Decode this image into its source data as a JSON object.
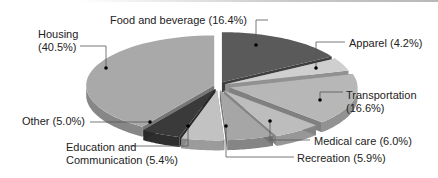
{
  "chart_data": {
    "type": "pie",
    "style": "3d-exploded",
    "title": "",
    "categories": [
      "Food and beverage",
      "Apparel",
      "Transportation",
      "Medical care",
      "Recreation",
      "Education and Communication",
      "Other",
      "Housing"
    ],
    "values": [
      16.4,
      4.2,
      16.6,
      6.0,
      5.9,
      5.4,
      5.0,
      40.5
    ],
    "unit": "%",
    "colors": [
      "#5a5a5a",
      "#cfcfcf",
      "#b7b7b7",
      "#bdbdbd",
      "#a6a6a6",
      "#c2c2c2",
      "#3a3a3a",
      "#a9a9a9"
    ],
    "legend": "none (callout labels)"
  },
  "labels": {
    "food": "Food and beverage (16.4%)",
    "apparel": "Apparel (4.2%)",
    "transport_1": "Transportation",
    "transport_2": "(16.6%)",
    "medical": "Medical care (6.0%)",
    "recreation": "Recreation (5.9%)",
    "education_1": "Education and",
    "education_2": "Communication (5.4%)",
    "other": "Other (5.0%)",
    "housing_1": "Housing",
    "housing_2": "(40.5%)"
  }
}
